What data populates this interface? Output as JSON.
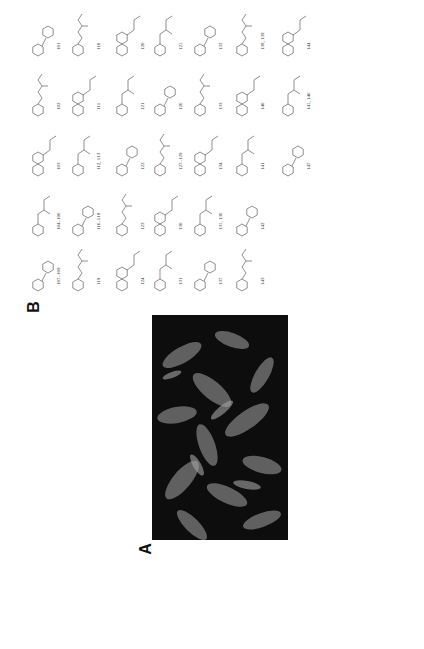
{
  "figure": {
    "panel_a": {
      "label": "A",
      "content": "photograph of plant foliage (dark green leaves), grayscale"
    },
    "panel_b": {
      "label": "B",
      "content": "chemical structures of isolated compounds"
    }
  },
  "compounds": [
    {
      "id": "101"
    },
    {
      "id": "102"
    },
    {
      "id": "103"
    },
    {
      "id": "104",
      "note": "104 R1 = H, R2 = R3 = Me"
    },
    {
      "id": "105"
    },
    {
      "id": "106"
    },
    {
      "id": "107"
    },
    {
      "id": "108"
    },
    {
      "id": "109"
    },
    {
      "id": "110"
    },
    {
      "id": "111"
    },
    {
      "id": "112",
      "note": "112 R1 = OH, R2 = H, R3 = CH3"
    },
    {
      "id": "113",
      "note": "113 R1 = H, R2 = OH, R3 = H"
    },
    {
      "id": "114"
    },
    {
      "id": "115"
    },
    {
      "id": "116"
    },
    {
      "id": "117"
    },
    {
      "id": "118",
      "note": "116 n = 1, 117 n = 1, 118 n = 1"
    },
    {
      "id": "119"
    },
    {
      "id": "120"
    },
    {
      "id": "121"
    },
    {
      "id": "122"
    },
    {
      "id": "123"
    },
    {
      "id": "124"
    },
    {
      "id": "125"
    },
    {
      "id": "126"
    },
    {
      "id": "127"
    },
    {
      "id": "128"
    },
    {
      "id": "129",
      "note": "127 R1 = OMe, R2 = Me; 128 R1 = H, R2 = Me; 129 R1 = R2 = H"
    },
    {
      "id": "130"
    },
    {
      "id": "131"
    },
    {
      "id": "132"
    },
    {
      "id": "133"
    },
    {
      "id": "134"
    },
    {
      "id": "135"
    },
    {
      "id": "136",
      "note": "135 R = H; 136 R = Me"
    },
    {
      "id": "137"
    },
    {
      "id": "138"
    },
    {
      "id": "139",
      "note": "138 R = Me; 139 R = isobutyl"
    },
    {
      "id": "140"
    },
    {
      "id": "141"
    },
    {
      "id": "142"
    },
    {
      "id": "143"
    },
    {
      "id": "144"
    },
    {
      "id": "145"
    },
    {
      "id": "146"
    },
    {
      "id": "147"
    }
  ],
  "grid_labels": {
    "c101": "101",
    "c102": "102",
    "c103": "103",
    "c104": "104–106",
    "c105": "107–109",
    "c106": "110",
    "c107": "111",
    "c108": "112, 113",
    "c109": "116–118",
    "c110": "119",
    "c111": "120",
    "c112": "121",
    "c113": "122",
    "c114": "123",
    "c115": "124",
    "c116": "125",
    "c117": "126",
    "c118": "127–129",
    "c119": "130",
    "c120": "131",
    "c121": "132",
    "c122": "133",
    "c123": "134",
    "c124": "135, 136",
    "c125": "137",
    "c126": "138, 139",
    "c127": "140",
    "c128": "141",
    "c129": "142",
    "c130": "143",
    "c131": "144",
    "c132": "145, 146",
    "c133": "147"
  },
  "colors": {
    "background": "#ffffff",
    "ink": "#222222",
    "photo_dark": "#0c0c0c",
    "leaf_light": "#8a8a8a"
  }
}
